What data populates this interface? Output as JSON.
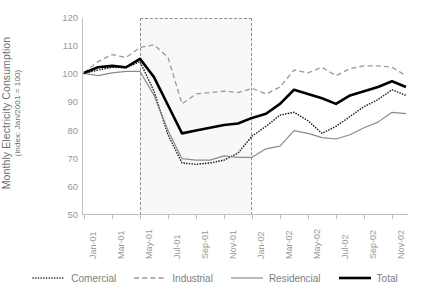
{
  "chart_data": {
    "type": "line",
    "title": "",
    "xlabel": "",
    "ylabel": "Monthly Electricity Consumption",
    "ylabel_sub": "(index: Jan/2001 = 100)",
    "ylim": [
      50,
      120
    ],
    "yticks": [
      50,
      60,
      70,
      80,
      90,
      100,
      110,
      120
    ],
    "grid": false,
    "legend_position": "bottom",
    "x": [
      "Jan-01",
      "Feb-01",
      "Mar-01",
      "Apr-01",
      "May-01",
      "Jun-01",
      "Jul-01",
      "Aug-01",
      "Sep-01",
      "Oct-01",
      "Nov-01",
      "Dec-01",
      "Jan-02",
      "Feb-02",
      "Mar-02",
      "Apr-02",
      "May-02",
      "Jun-02",
      "Jul-02",
      "Aug-02",
      "Sep-02",
      "Oct-02",
      "Nov-02",
      "Dec-02"
    ],
    "xtick_labels": [
      "Jan-01",
      "Mar-01",
      "May-01",
      "Jul-01",
      "Sep-01",
      "Nov-01",
      "Jan-02",
      "Mar-02",
      "May-02",
      "Jul-02",
      "Sep-02",
      "Nov-02"
    ],
    "annotations": [
      {
        "name": "rationing-period-band",
        "from": "May-01",
        "to": "Jan-02",
        "style": "dashed-rectangle"
      }
    ],
    "series": [
      {
        "name": "Comercial",
        "style": "dotted",
        "color": "#1a1a1a",
        "values": [
          100.3,
          101.5,
          102.5,
          102.3,
          104.5,
          94.0,
          78.5,
          68.5,
          68.0,
          68.5,
          69.5,
          72.0,
          78.0,
          81.5,
          85.5,
          86.5,
          83.5,
          79.0,
          81.5,
          85.0,
          88.5,
          91.0,
          94.5,
          92.5
        ]
      },
      {
        "name": "Industrial",
        "style": "dashed",
        "color": "#9a9a9a",
        "values": [
          100.5,
          104.5,
          107.0,
          106.0,
          109.5,
          110.5,
          106.0,
          89.5,
          93.0,
          93.5,
          94.0,
          93.5,
          95.0,
          93.0,
          95.5,
          101.5,
          100.5,
          102.5,
          99.5,
          102.0,
          103.0,
          103.0,
          102.5,
          99.5
        ]
      },
      {
        "name": "Residencial",
        "style": "solid-thin",
        "color": "#8a8a8a",
        "values": [
          100.3,
          99.5,
          100.5,
          101.0,
          101.0,
          92.5,
          80.0,
          70.0,
          69.5,
          69.5,
          71.0,
          70.5,
          70.5,
          73.5,
          74.5,
          80.0,
          79.0,
          77.5,
          77.0,
          78.5,
          81.0,
          83.0,
          86.5,
          86.0
        ]
      },
      {
        "name": "Total",
        "style": "solid-thick",
        "color": "#000000",
        "values": [
          100.5,
          102.5,
          103.0,
          102.5,
          105.5,
          99.0,
          89.0,
          79.0,
          80.0,
          81.0,
          82.0,
          82.5,
          84.5,
          86.0,
          89.5,
          94.5,
          93.0,
          91.5,
          89.5,
          92.5,
          94.0,
          95.5,
          97.5,
          95.5
        ]
      }
    ]
  },
  "legend": {
    "items": [
      {
        "label": "Comercial",
        "glyph": "dotted-line-icon"
      },
      {
        "label": "Industrial",
        "glyph": "dashed-line-icon"
      },
      {
        "label": "Residencial",
        "glyph": "thin-solid-line-icon"
      },
      {
        "label": "Total",
        "glyph": "thick-solid-line-icon"
      }
    ]
  }
}
